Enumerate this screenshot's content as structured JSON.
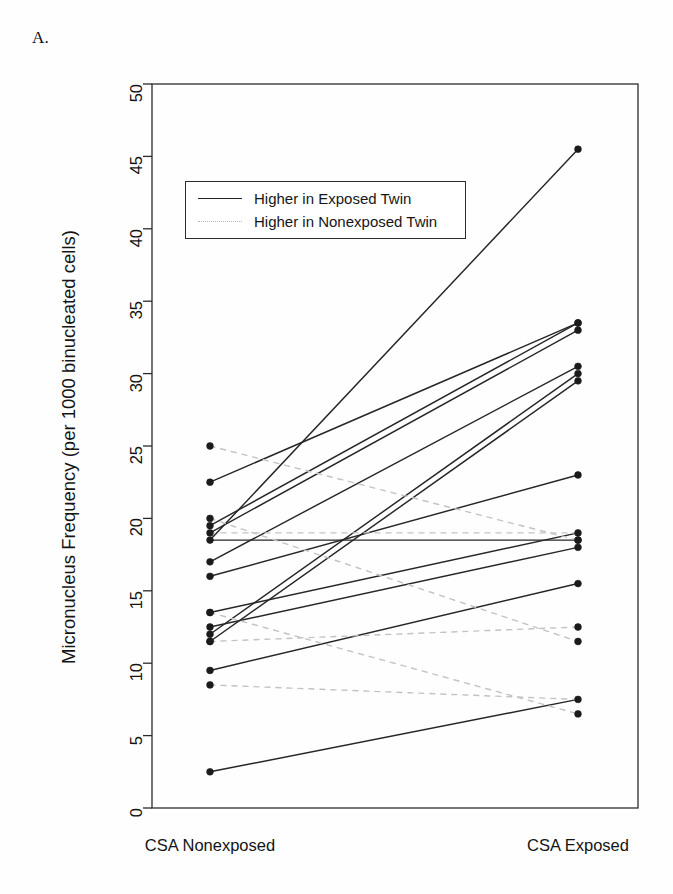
{
  "figure": {
    "panel_label": "A.",
    "ylabel": "Micronucleus Frequency (per 1000 binucleated cells)"
  },
  "legend": {
    "entries": [
      {
        "label": "Higher in Exposed Twin",
        "style": "solid",
        "color": "#232323"
      },
      {
        "label": "Higher in Nonexposed Twin",
        "style": "dotted",
        "color": "#b9b9b9"
      }
    ]
  },
  "chart_data": {
    "type": "line",
    "subtype": "paired-slope-plot",
    "title": "",
    "xlabel": "",
    "ylabel": "Micronucleus Frequency (per 1000 binucleated cells)",
    "categories": [
      "CSA Nonexposed",
      "CSA Exposed"
    ],
    "xtick_labels": [
      "CSA Nonexposed",
      "CSA Exposed"
    ],
    "ylim": [
      0,
      50
    ],
    "ytick_labels": [
      "0",
      "5",
      "10",
      "15",
      "20",
      "25",
      "30",
      "35",
      "40",
      "45",
      "50"
    ],
    "yticks": [
      0,
      5,
      10,
      15,
      20,
      25,
      30,
      35,
      40,
      45,
      50
    ],
    "grid": false,
    "legend_position": "upper-left-inside",
    "series": [
      {
        "name": "pair-01",
        "group": "Higher in Exposed Twin",
        "style": "solid",
        "values": [
          18.5,
          45.5
        ]
      },
      {
        "name": "pair-02",
        "group": "Higher in Exposed Twin",
        "style": "solid",
        "values": [
          22.5,
          33.5
        ]
      },
      {
        "name": "pair-03",
        "group": "Higher in Exposed Twin",
        "style": "solid",
        "values": [
          19.5,
          33.5
        ]
      },
      {
        "name": "pair-04",
        "group": "Higher in Exposed Twin",
        "style": "solid",
        "values": [
          19.0,
          33.0
        ]
      },
      {
        "name": "pair-05",
        "group": "Higher in Exposed Twin",
        "style": "solid",
        "values": [
          17.0,
          30.5
        ]
      },
      {
        "name": "pair-06",
        "group": "Higher in Exposed Twin",
        "style": "solid",
        "values": [
          12.0,
          30.0
        ]
      },
      {
        "name": "pair-07",
        "group": "Higher in Exposed Twin",
        "style": "solid",
        "values": [
          11.5,
          29.5
        ]
      },
      {
        "name": "pair-08",
        "group": "Higher in Exposed Twin",
        "style": "solid",
        "values": [
          16.0,
          23.0
        ]
      },
      {
        "name": "pair-09",
        "group": "Higher in Exposed Twin",
        "style": "solid",
        "values": [
          13.5,
          19.0
        ]
      },
      {
        "name": "pair-10",
        "group": "Higher in Exposed Twin",
        "style": "solid",
        "values": [
          18.5,
          18.5
        ]
      },
      {
        "name": "pair-11",
        "group": "Higher in Exposed Twin",
        "style": "solid",
        "values": [
          12.5,
          18.0
        ]
      },
      {
        "name": "pair-12",
        "group": "Higher in Exposed Twin",
        "style": "solid",
        "values": [
          9.5,
          15.5
        ]
      },
      {
        "name": "pair-13",
        "group": "Higher in Exposed Twin",
        "style": "solid",
        "values": [
          2.5,
          7.5
        ]
      },
      {
        "name": "pair-14",
        "group": "Higher in Nonexposed Twin",
        "style": "dotted",
        "values": [
          25.0,
          18.5
        ]
      },
      {
        "name": "pair-15",
        "group": "Higher in Nonexposed Twin",
        "style": "dotted",
        "values": [
          19.0,
          19.0
        ]
      },
      {
        "name": "pair-16",
        "group": "Higher in Nonexposed Twin",
        "style": "dotted",
        "values": [
          20.0,
          11.5
        ]
      },
      {
        "name": "pair-17",
        "group": "Higher in Nonexposed Twin",
        "style": "dotted",
        "values": [
          13.5,
          6.5
        ]
      },
      {
        "name": "pair-18",
        "group": "Higher in Nonexposed Twin",
        "style": "dotted",
        "values": [
          8.5,
          7.5
        ]
      },
      {
        "name": "pair-19",
        "group": "Higher in Nonexposed Twin",
        "style": "dotted",
        "values": [
          11.5,
          12.5
        ]
      }
    ],
    "nonexposed_points": [
      25.0,
      22.5,
      20.0,
      19.5,
      19.0,
      18.5,
      17.0,
      16.0,
      13.5,
      13.5,
      12.5,
      12.0,
      11.5,
      11.5,
      9.5,
      8.5,
      2.5
    ],
    "exposed_points": [
      45.5,
      33.5,
      33.5,
      33.0,
      30.5,
      30.0,
      29.5,
      23.0,
      19.0,
      18.5,
      18.5,
      18.0,
      15.5,
      12.5,
      11.5,
      7.5,
      6.5
    ],
    "axis": {
      "plot_left_px": 152,
      "plot_right_px": 638,
      "plot_top_px": 84,
      "plot_bottom_px": 808,
      "cat_x_px": [
        210,
        578
      ]
    }
  }
}
